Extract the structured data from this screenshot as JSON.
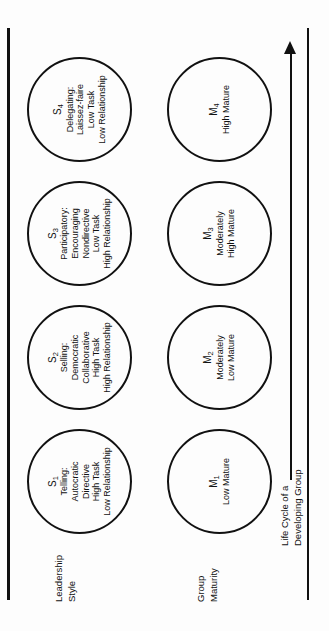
{
  "figure": {
    "orientation": "rotated-90-ccw"
  },
  "rows": [
    {
      "id": "leadership-style",
      "label_lines": [
        "Leadership",
        "Style"
      ]
    },
    {
      "id": "group-maturity",
      "label_lines": [
        "Group",
        "Maturity"
      ]
    }
  ],
  "leadership_styles": [
    {
      "code": "S",
      "index": "1",
      "lines": [
        "Telling:",
        "Autocratic",
        "Directive",
        "High Task",
        "Low Relationship"
      ]
    },
    {
      "code": "S",
      "index": "2",
      "lines": [
        "Selling:",
        "Democratic",
        "Collaborative",
        "High Task",
        "High Relationship"
      ]
    },
    {
      "code": "S",
      "index": "3",
      "lines": [
        "Participatory:",
        "Encouraging",
        "Nondirective",
        "Low Task",
        "High Relationship"
      ]
    },
    {
      "code": "S",
      "index": "4",
      "lines": [
        "Delegating:",
        "Laissez-faire",
        "Low Task",
        "Low Relationship"
      ]
    }
  ],
  "group_maturity": [
    {
      "code": "M",
      "index": "1",
      "lines": [
        "Low Mature"
      ]
    },
    {
      "code": "M",
      "index": "2",
      "lines": [
        "Moderately",
        "Low Mature"
      ]
    },
    {
      "code": "M",
      "index": "3",
      "lines": [
        "Moderately",
        "High Mature"
      ]
    },
    {
      "code": "M",
      "index": "4",
      "lines": [
        "High Mature"
      ]
    }
  ],
  "arrow": {
    "caption_lines": [
      "Life Cycle of a",
      "Developing Group"
    ],
    "direction": "right"
  },
  "colors": {
    "ink": "#111111",
    "background": "#fdfdfd"
  }
}
